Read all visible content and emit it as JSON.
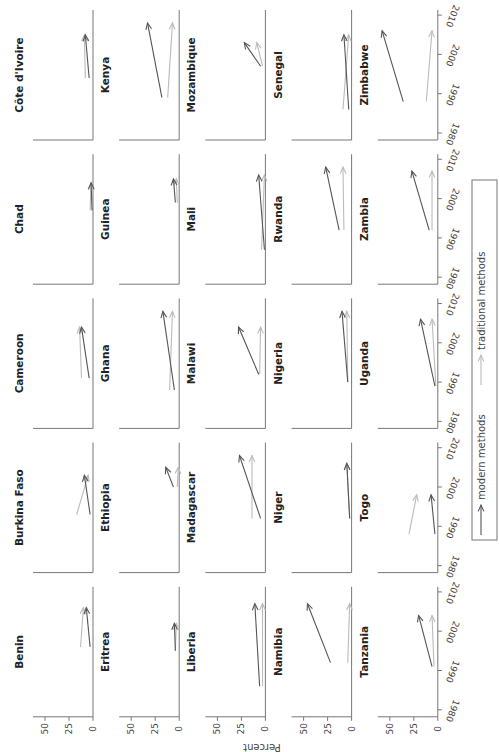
{
  "chart_data": {
    "type": "line",
    "subtype": "small-multiples arrow plot (rotated 90° counter-clockwise)",
    "title": "",
    "xlabel": "",
    "ylabel": "Percent",
    "x_ticks": [
      1980,
      1990,
      2000,
      2010
    ],
    "y_ticks": [
      0,
      25,
      50
    ],
    "xlim": [
      1978,
      2012
    ],
    "ylim": [
      0,
      55
    ],
    "legend": {
      "position": "right",
      "entries": [
        {
          "name": "modern methods",
          "color": "#555555"
        },
        {
          "name": "traditional methods",
          "color": "#bbbbbb"
        }
      ]
    },
    "series_colors": {
      "modern": "#555555",
      "traditional": "#bbbbbb"
    },
    "panels": [
      {
        "country": "Côte d'Ivoire",
        "row": 0,
        "col": 0,
        "modern": {
          "start": [
            1994,
            4
          ],
          "end": [
            2005,
            8
          ]
        },
        "traditional": {
          "start": [
            1994,
            8
          ],
          "end": [
            2005,
            9
          ]
        }
      },
      {
        "country": "Kenya",
        "row": 0,
        "col": 1,
        "modern": {
          "start": [
            1989,
            18
          ],
          "end": [
            2008,
            33
          ]
        },
        "traditional": {
          "start": [
            1989,
            12
          ],
          "end": [
            2008,
            7
          ]
        }
      },
      {
        "country": "Mozambique",
        "row": 0,
        "col": 2,
        "modern": {
          "start": [
            1997,
            5
          ],
          "end": [
            2003,
            22
          ]
        },
        "traditional": {
          "start": [
            1997,
            3
          ],
          "end": [
            2003,
            9
          ]
        }
      },
      {
        "country": "Senegal",
        "row": 0,
        "col": 3,
        "modern": {
          "start": [
            1986,
            3
          ],
          "end": [
            2005,
            8
          ]
        },
        "traditional": {
          "start": [
            1986,
            9
          ],
          "end": [
            2005,
            3
          ]
        }
      },
      {
        "country": "Zimbabwe",
        "row": 0,
        "col": 4,
        "modern": {
          "start": [
            1988,
            36
          ],
          "end": [
            2006,
            58
          ]
        },
        "traditional": {
          "start": [
            1988,
            12
          ],
          "end": [
            2006,
            6
          ]
        }
      },
      {
        "country": "Chad",
        "row": 1,
        "col": 0,
        "modern": {
          "start": [
            1997,
            1
          ],
          "end": [
            2004,
            2
          ]
        },
        "traditional": {
          "start": [
            1997,
            3
          ],
          "end": [
            2004,
            2
          ]
        }
      },
      {
        "country": "Guinea",
        "row": 1,
        "col": 1,
        "modern": {
          "start": [
            1999,
            4
          ],
          "end": [
            2005,
            6
          ]
        },
        "traditional": {
          "start": [
            1999,
            2
          ],
          "end": [
            2005,
            3
          ]
        }
      },
      {
        "country": "Mali",
        "row": 1,
        "col": 2,
        "modern": {
          "start": [
            1987,
            1
          ],
          "end": [
            2006,
            7
          ]
        },
        "traditional": {
          "start": [
            1987,
            4
          ],
          "end": [
            2006,
            1
          ]
        }
      },
      {
        "country": "Rwanda",
        "row": 1,
        "col": 3,
        "modern": {
          "start": [
            1992,
            13
          ],
          "end": [
            2008,
            27
          ]
        },
        "traditional": {
          "start": [
            1992,
            8
          ],
          "end": [
            2008,
            9
          ]
        }
      },
      {
        "country": "Zambia",
        "row": 1,
        "col": 4,
        "modern": {
          "start": [
            1992,
            9
          ],
          "end": [
            2007,
            27
          ]
        },
        "traditional": {
          "start": [
            1992,
            6
          ],
          "end": [
            2007,
            6
          ]
        }
      },
      {
        "country": "Cameroon",
        "row": 2,
        "col": 0,
        "modern": {
          "start": [
            1991,
            4
          ],
          "end": [
            2004,
            12
          ]
        },
        "traditional": {
          "start": [
            1991,
            12
          ],
          "end": [
            2004,
            14
          ]
        }
      },
      {
        "country": "Ghana",
        "row": 2,
        "col": 1,
        "modern": {
          "start": [
            1988,
            5
          ],
          "end": [
            2008,
            17
          ]
        },
        "traditional": {
          "start": [
            1988,
            10
          ],
          "end": [
            2008,
            7
          ]
        }
      },
      {
        "country": "Malawi",
        "row": 2,
        "col": 2,
        "modern": {
          "start": [
            1992,
            7
          ],
          "end": [
            2004,
            28
          ]
        },
        "traditional": {
          "start": [
            1992,
            6
          ],
          "end": [
            2004,
            5
          ]
        }
      },
      {
        "country": "Nigeria",
        "row": 2,
        "col": 3,
        "modern": {
          "start": [
            1990,
            4
          ],
          "end": [
            2008,
            10
          ]
        },
        "traditional": {
          "start": [
            1990,
            4
          ],
          "end": [
            2008,
            5
          ]
        }
      },
      {
        "country": "Uganda",
        "row": 2,
        "col": 4,
        "modern": {
          "start": [
            1989,
            3
          ],
          "end": [
            2006,
            18
          ]
        },
        "traditional": {
          "start": [
            1989,
            2
          ],
          "end": [
            2006,
            6
          ]
        }
      },
      {
        "country": "Burkina Faso",
        "row": 3,
        "col": 0,
        "modern": {
          "start": [
            1993,
            3
          ],
          "end": [
            2003,
            9
          ]
        },
        "traditional": {
          "start": [
            1993,
            17
          ],
          "end": [
            2003,
            5
          ]
        }
      },
      {
        "country": "Ethiopia",
        "row": 3,
        "col": 1,
        "modern": {
          "start": [
            2000,
            6
          ],
          "end": [
            2005,
            14
          ]
        },
        "traditional": {
          "start": [
            2000,
            2
          ],
          "end": [
            2005,
            1
          ]
        }
      },
      {
        "country": "Madagascar",
        "row": 3,
        "col": 2,
        "modern": {
          "start": [
            1992,
            5
          ],
          "end": [
            2008,
            27
          ]
        },
        "traditional": {
          "start": [
            1992,
            14
          ],
          "end": [
            2008,
            14
          ]
        }
      },
      {
        "country": "Niger",
        "row": 3,
        "col": 3,
        "modern": {
          "start": [
            1992,
            2
          ],
          "end": [
            2006,
            5
          ]
        },
        "traditional": {
          "start": [
            1992,
            2
          ],
          "end": [
            2006,
            5
          ]
        }
      },
      {
        "country": "Togo",
        "row": 3,
        "col": 4,
        "modern": {
          "start": [
            1988,
            3
          ],
          "end": [
            1998,
            7
          ]
        },
        "traditional": {
          "start": [
            1988,
            30
          ],
          "end": [
            1998,
            22
          ]
        }
      },
      {
        "country": "Benin",
        "row": 4,
        "col": 0,
        "modern": {
          "start": [
            1996,
            3
          ],
          "end": [
            2006,
            7
          ]
        },
        "traditional": {
          "start": [
            1996,
            13
          ],
          "end": [
            2006,
            10
          ]
        }
      },
      {
        "country": "Eritrea",
        "row": 4,
        "col": 1,
        "modern": {
          "start": [
            1995,
            4
          ],
          "end": [
            2002,
            5
          ]
        },
        "traditional": {
          "start": [
            1995,
            4
          ],
          "end": [
            2002,
            3
          ]
        }
      },
      {
        "country": "Liberia",
        "row": 4,
        "col": 2,
        "modern": {
          "start": [
            1986,
            6
          ],
          "end": [
            2007,
            11
          ]
        },
        "traditional": {
          "start": [
            1986,
            3
          ],
          "end": [
            2007,
            3
          ]
        }
      },
      {
        "country": "Namibia",
        "row": 4,
        "col": 3,
        "modern": {
          "start": [
            1992,
            22
          ],
          "end": [
            2007,
            46
          ]
        },
        "traditional": {
          "start": [
            1992,
            4
          ],
          "end": [
            2007,
            2
          ]
        }
      },
      {
        "country": "Tanzania",
        "row": 4,
        "col": 4,
        "modern": {
          "start": [
            1991,
            6
          ],
          "end": [
            2004,
            20
          ]
        },
        "traditional": {
          "start": [
            1991,
            4
          ],
          "end": [
            2004,
            6
          ]
        }
      }
    ]
  }
}
